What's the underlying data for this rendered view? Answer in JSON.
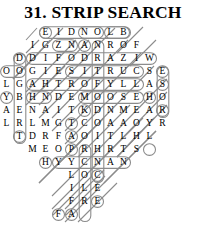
{
  "puzzle": {
    "number": "31.",
    "name": "STRIP SEARCH",
    "title": "31. STRIP SEARCH",
    "type": "word-search",
    "grid_rows": 15,
    "cell_size": 13,
    "ink_color": "#000000",
    "marker_color": "#8c8c8c",
    "rows": [
      {
        "indent": 3,
        "letters": [
          "E",
          "I",
          "D",
          "N",
          "O",
          "L",
          "B"
        ]
      },
      {
        "indent": 2,
        "letters": [
          "I",
          "G",
          "Z",
          "N",
          "A",
          "N",
          "R",
          "O",
          "F"
        ]
      },
      {
        "indent": 1,
        "letters": [
          "D",
          "D",
          "I",
          "F",
          "O",
          "D",
          "R",
          "A",
          "Z",
          "I",
          "W"
        ]
      },
      {
        "indent": 0,
        "letters": [
          "O",
          "O",
          "G",
          "I",
          "E",
          "S",
          "I",
          "T",
          "R",
          "U",
          "C",
          "S",
          "E"
        ]
      },
      {
        "indent": 0,
        "letters": [
          "L",
          "G",
          "A",
          "H",
          "T",
          "R",
          "O",
          "F",
          "Y",
          "L",
          "L",
          "A",
          "S"
        ]
      },
      {
        "indent": 0,
        "letters": [
          "Y",
          "B",
          "H",
          "N",
          "D",
          "E",
          "M",
          "O",
          "O",
          "S",
          "E",
          "H",
          "O"
        ]
      },
      {
        "indent": 0,
        "letters": [
          "A",
          "E",
          "N",
          "A",
          "I",
          "T",
          "K",
          "D",
          "N",
          "M",
          "E",
          "A",
          "R"
        ]
      },
      {
        "indent": 0,
        "letters": [
          "L",
          "R",
          "L",
          "M",
          "G",
          "T",
          "C",
          "O",
          "A",
          "A",
          "O",
          "Y",
          "R"
        ]
      },
      {
        "indent": 1,
        "letters": [
          "T",
          "D",
          "R",
          "F",
          "A",
          "O",
          "I",
          "T",
          "L",
          "H",
          "L"
        ]
      },
      {
        "indent": 2,
        "letters": [
          "M",
          "E",
          "O",
          "P",
          "R",
          "H",
          "R",
          "T",
          "S"
        ]
      },
      {
        "indent": 3,
        "letters": [
          "H",
          "Y",
          "Y",
          "C",
          "N",
          "A",
          "N"
        ]
      },
      {
        "indent": 5,
        "letters": [
          "L",
          "O",
          "C"
        ]
      },
      {
        "indent": 5,
        "letters": [
          "I",
          "L",
          "E"
        ]
      },
      {
        "indent": 5,
        "letters": [
          "F",
          "R",
          "E"
        ]
      },
      {
        "indent": 4,
        "letters": [
          "F",
          "A"
        ]
      }
    ]
  }
}
